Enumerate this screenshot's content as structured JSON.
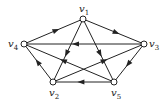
{
  "graph": {
    "type": "directed",
    "stroke_color": "#222222",
    "vertices": [
      {
        "id": "v1",
        "label": "v",
        "sub": "1",
        "x": 83,
        "y": 19,
        "lx": 79,
        "ly": 4
      },
      {
        "id": "v2",
        "label": "v",
        "sub": "2",
        "x": 53,
        "y": 82,
        "lx": 49,
        "ly": 88
      },
      {
        "id": "v3",
        "label": "v",
        "sub": "3",
        "x": 144,
        "y": 44,
        "lx": 149,
        "ly": 39
      },
      {
        "id": "v4",
        "label": "v",
        "sub": "4",
        "x": 24,
        "y": 44,
        "lx": 8,
        "ly": 39
      },
      {
        "id": "v5",
        "label": "v",
        "sub": "5",
        "x": 114,
        "y": 82,
        "lx": 111,
        "ly": 88
      }
    ],
    "edges": [
      {
        "from": "v4",
        "to": "v1"
      },
      {
        "from": "v1",
        "to": "v3"
      },
      {
        "from": "v3",
        "to": "v4"
      },
      {
        "from": "v1",
        "to": "v2"
      },
      {
        "from": "v1",
        "to": "v5"
      },
      {
        "from": "v3",
        "to": "v5"
      },
      {
        "from": "v5",
        "to": "v2"
      },
      {
        "from": "v2",
        "to": "v4"
      },
      {
        "from": "v5",
        "to": "v4"
      },
      {
        "from": "v2",
        "to": "v3"
      }
    ]
  }
}
